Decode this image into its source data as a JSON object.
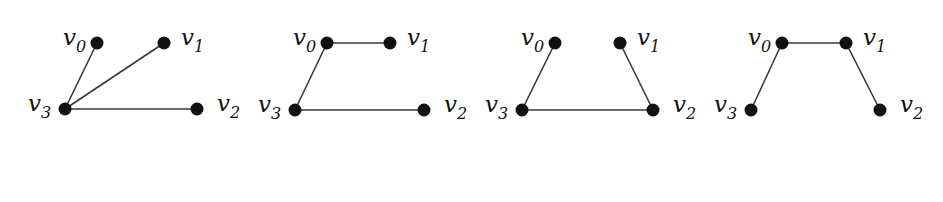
{
  "figure": {
    "style": {
      "background": "#ffffff",
      "edge_color": "#3a3a3a",
      "edge_width": 1.6,
      "node_color": "#111111",
      "node_radius": 6.5,
      "label_color": "#111111"
    },
    "graphs": [
      {
        "id": "graph-1",
        "nodes": [
          {
            "id": "v0",
            "base": "v",
            "sub": "0",
            "x": 97,
            "y": 43,
            "label_dx": -34,
            "label_dy": 2
          },
          {
            "id": "v1",
            "base": "v",
            "sub": "1",
            "x": 164,
            "y": 43,
            "label_dx": 17,
            "label_dy": 2
          },
          {
            "id": "v2",
            "base": "v",
            "sub": "2",
            "x": 197,
            "y": 109,
            "label_dx": 20,
            "label_dy": 2
          },
          {
            "id": "v3",
            "base": "v",
            "sub": "3",
            "x": 65,
            "y": 109,
            "label_dx": -37,
            "label_dy": 2
          }
        ],
        "edges": [
          [
            "v3",
            "v0"
          ],
          [
            "v3",
            "v1"
          ],
          [
            "v3",
            "v2"
          ]
        ]
      },
      {
        "id": "graph-2",
        "nodes": [
          {
            "id": "v0",
            "base": "v",
            "sub": "0",
            "x": 327,
            "y": 43,
            "label_dx": -34,
            "label_dy": 2
          },
          {
            "id": "v1",
            "base": "v",
            "sub": "1",
            "x": 390,
            "y": 43,
            "label_dx": 17,
            "label_dy": 2
          },
          {
            "id": "v2",
            "base": "v",
            "sub": "2",
            "x": 424,
            "y": 110,
            "label_dx": 20,
            "label_dy": 2
          },
          {
            "id": "v3",
            "base": "v",
            "sub": "3",
            "x": 295,
            "y": 110,
            "label_dx": -37,
            "label_dy": 2
          }
        ],
        "edges": [
          [
            "v0",
            "v1"
          ],
          [
            "v0",
            "v3"
          ],
          [
            "v3",
            "v2"
          ]
        ]
      },
      {
        "id": "graph-3",
        "nodes": [
          {
            "id": "v0",
            "base": "v",
            "sub": "0",
            "x": 555,
            "y": 43,
            "label_dx": -34,
            "label_dy": 2
          },
          {
            "id": "v1",
            "base": "v",
            "sub": "1",
            "x": 620,
            "y": 43,
            "label_dx": 17,
            "label_dy": 2
          },
          {
            "id": "v2",
            "base": "v",
            "sub": "2",
            "x": 653,
            "y": 110,
            "label_dx": 20,
            "label_dy": 2
          },
          {
            "id": "v3",
            "base": "v",
            "sub": "3",
            "x": 522,
            "y": 110,
            "label_dx": -37,
            "label_dy": 2
          }
        ],
        "edges": [
          [
            "v0",
            "v3"
          ],
          [
            "v3",
            "v2"
          ],
          [
            "v2",
            "v1"
          ]
        ]
      },
      {
        "id": "graph-4",
        "nodes": [
          {
            "id": "v0",
            "base": "v",
            "sub": "0",
            "x": 782,
            "y": 43,
            "label_dx": -34,
            "label_dy": 2
          },
          {
            "id": "v1",
            "base": "v",
            "sub": "1",
            "x": 846,
            "y": 43,
            "label_dx": 17,
            "label_dy": 2
          },
          {
            "id": "v2",
            "base": "v",
            "sub": "2",
            "x": 880,
            "y": 110,
            "label_dx": 20,
            "label_dy": 2
          },
          {
            "id": "v3",
            "base": "v",
            "sub": "3",
            "x": 751,
            "y": 110,
            "label_dx": -37,
            "label_dy": 2
          }
        ],
        "edges": [
          [
            "v3",
            "v0"
          ],
          [
            "v0",
            "v1"
          ],
          [
            "v1",
            "v2"
          ]
        ]
      }
    ]
  }
}
